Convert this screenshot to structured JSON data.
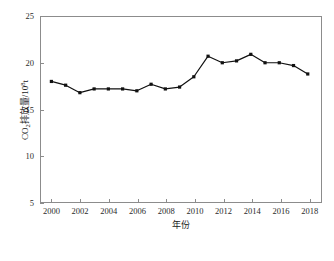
{
  "chart_data": {
    "type": "line",
    "title": "",
    "xlabel": "年份",
    "ylabel_text": "CO2排放量/108t",
    "ylabel_parts": {
      "prefix": "CO",
      "sub": "2",
      "mid": "排放量/10",
      "sup": "8",
      "suffix": "t"
    },
    "x": [
      2000,
      2001,
      2002,
      2003,
      2004,
      2005,
      2006,
      2007,
      2008,
      2009,
      2010,
      2011,
      2012,
      2013,
      2014,
      2015,
      2016,
      2017,
      2018
    ],
    "values": [
      18.0,
      17.6,
      16.8,
      17.2,
      17.2,
      17.2,
      17.0,
      17.7,
      17.2,
      17.4,
      18.5,
      20.7,
      20.0,
      20.2,
      20.9,
      20.0,
      20.0,
      19.7,
      18.8
    ],
    "series": [
      {
        "name": "CO2排放量",
        "values": [
          18.0,
          17.6,
          16.8,
          17.2,
          17.2,
          17.2,
          17.0,
          17.7,
          17.2,
          17.4,
          18.5,
          20.7,
          20.0,
          20.2,
          20.9,
          20.0,
          20.0,
          19.7,
          18.8
        ]
      }
    ],
    "xlim": [
      1999.2,
      2019.0
    ],
    "ylim": [
      5,
      25
    ],
    "xticks": [
      2000,
      2002,
      2004,
      2006,
      2008,
      2010,
      2012,
      2014,
      2016,
      2018
    ],
    "yticks": [
      5,
      10,
      15,
      20,
      25
    ],
    "xtick_labels": [
      "2000",
      "2002",
      "2004",
      "2006",
      "2008",
      "2010",
      "2012",
      "2014",
      "2016",
      "2018"
    ],
    "ytick_labels": [
      "5",
      "10",
      "15",
      "20",
      "25"
    ],
    "grid": false,
    "legend": null,
    "marker": "square",
    "line_color": "#111111",
    "marker_color": "#111111",
    "axis_color": "#8c8c8c",
    "background": "#ffffff"
  }
}
